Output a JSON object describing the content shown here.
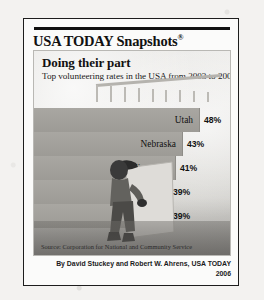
{
  "masthead": {
    "brand": "USA TODAY Snapshots",
    "registered_mark": "®"
  },
  "headline": "Doing their part",
  "subhead": "Top volunteering rates in the USA from 2003 to 2005:",
  "source": "Source: Corporation for National and Community Service",
  "credit": {
    "authors": "By David Stuckey and Robert W. Ahrens, USA TODAY",
    "year": "2006"
  },
  "colors": {
    "frame": "#1d1d1d",
    "bar": "#a9a7a2",
    "panel_bg": "#e7e6e3",
    "text": "#111111"
  },
  "chart_data": {
    "type": "bar",
    "orientation": "horizontal",
    "title": "Doing their part",
    "subtitle": "Top volunteering rates in the USA from 2003 to 2005:",
    "xlabel": "",
    "ylabel": "",
    "categories": [
      "Utah",
      "Nebraska",
      "Minnesota",
      "Iowa",
      "Alaska"
    ],
    "values": [
      48,
      43,
      41,
      39,
      39
    ],
    "value_labels": [
      "48%",
      "43%",
      "41%",
      "39%",
      "39%"
    ],
    "unit": "percent",
    "xlim": [
      0,
      50
    ],
    "grid": false,
    "legend": false,
    "source": "Source: Corporation for National and Community Service"
  }
}
